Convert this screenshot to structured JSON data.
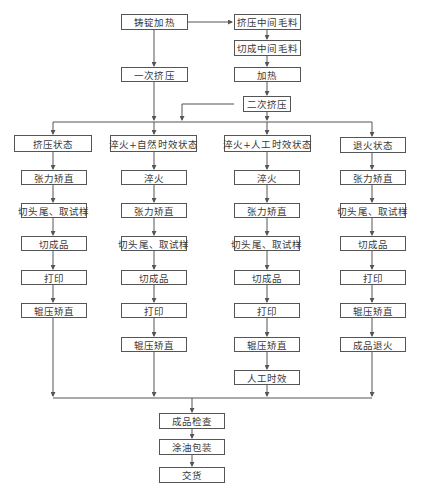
{
  "diagram": {
    "type": "process-flowchart",
    "top": {
      "ingot_heating": "铸锭加热",
      "first_extrusion": "一次挤压",
      "extrude_intermediate": "挤压中间毛料",
      "cut_intermediate": "切成中间毛料",
      "heating": "加热",
      "second_extrusion": "二次挤压"
    },
    "columns": [
      {
        "header": "挤压状态",
        "steps": [
          "张力矫直",
          "切头尾、取试样",
          "切成品",
          "打印",
          "辊压矫直"
        ]
      },
      {
        "header": "淬火+自然时效状态",
        "steps": [
          "淬火",
          "张力矫直",
          "切头尾、取试样",
          "切成品",
          "打印",
          "辊压矫直"
        ]
      },
      {
        "header": "淬火+人工时效状态",
        "steps": [
          "淬火",
          "张力矫直",
          "切头尾、取试样",
          "切成品",
          "打印",
          "辊压矫直",
          "人工时效"
        ]
      },
      {
        "header": "退火状态",
        "steps": [
          "张力矫直",
          "切头尾、取试样",
          "切成品",
          "打印",
          "辊压矫直",
          "成品退火"
        ]
      }
    ],
    "bottom": {
      "inspection": "成品检查",
      "oiling_packing": "涂油包装",
      "delivery": "交货"
    },
    "colors": {
      "line": "#555555",
      "text": "#3a3a3a",
      "background": "#ffffff"
    }
  }
}
